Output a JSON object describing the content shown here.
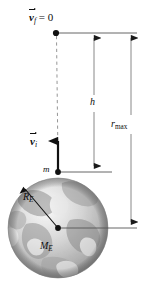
{
  "figure": {
    "type": "physics-diagram",
    "background_color": "#ffffff",
    "line_color": "#555555",
    "ink_color": "#0d0d0d"
  },
  "labels": {
    "final_velocity": {
      "vector": "v",
      "subscript": "f",
      "equals": "= 0",
      "text": "v⃗f = 0"
    },
    "initial_velocity": {
      "vector": "v",
      "subscript": "i",
      "text": "v⃗i"
    },
    "height": "h",
    "max_radius": {
      "base": "r",
      "subscript": "max",
      "text": "rmax"
    },
    "mass": "m",
    "earth_radius": {
      "base": "R",
      "subscript": "E",
      "text": "RE"
    },
    "earth_mass": {
      "base": "M",
      "subscript": "E",
      "text": "ME"
    }
  },
  "geometry": {
    "apex_point": {
      "x": 56,
      "y": 33
    },
    "earth_center": {
      "x": 58,
      "y": 228
    },
    "surface_point": {
      "x": 58,
      "y": 172
    },
    "earth_radius_px": 50,
    "h_line_x": 94,
    "rmax_line_x": 131,
    "top_rule": {
      "x1": 56,
      "x2": 137,
      "y": 33
    },
    "surface_rule": {
      "x1": 58,
      "x2": 112,
      "y": 172
    },
    "center_rule": {
      "x1": 58,
      "x2": 137,
      "y": 228
    }
  }
}
